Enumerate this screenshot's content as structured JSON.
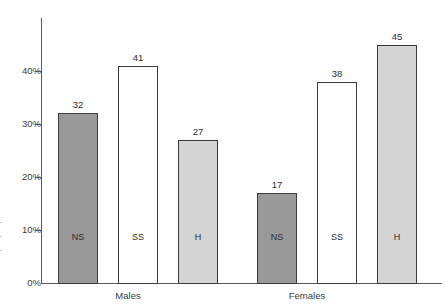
{
  "chart_data": {
    "type": "bar",
    "title": "",
    "subtitle": "",
    "xlabel": "",
    "ylabel": "",
    "ylim": [
      0,
      47
    ],
    "grid": false,
    "legend_position": "none",
    "value_suffix": "",
    "categories": [
      "Males",
      "Females"
    ],
    "subcategories": [
      "NS",
      "SS",
      "H"
    ],
    "y_ticks": [
      {
        "value": 0,
        "label": "0%"
      },
      {
        "value": 10,
        "label": "10%"
      },
      {
        "value": 20,
        "label": "20%"
      },
      {
        "value": 30,
        "label": "30%"
      },
      {
        "value": 40,
        "label": "40%"
      }
    ],
    "bars": [
      {
        "group": "Males",
        "subcategory": "NS",
        "value": 32,
        "label": "32",
        "inlabel": "NS",
        "fill": "#999999",
        "style": "fill-ns"
      },
      {
        "group": "Males",
        "subcategory": "SS",
        "value": 41,
        "label": "41",
        "inlabel": "SS",
        "fill": "#ffffff",
        "style": "fill-ss"
      },
      {
        "group": "Males",
        "subcategory": "H",
        "value": 27,
        "label": "27",
        "inlabel": "H",
        "fill": "#d4d4d4",
        "style": "fill-h"
      },
      {
        "group": "Females",
        "subcategory": "NS",
        "value": 17,
        "label": "17",
        "inlabel": "NS",
        "fill": "#999999",
        "style": "fill-ns"
      },
      {
        "group": "Females",
        "subcategory": "SS",
        "value": 38,
        "label": "38",
        "inlabel": "SS",
        "fill": "#ffffff",
        "style": "fill-ss"
      },
      {
        "group": "Females",
        "subcategory": "H",
        "value": 45,
        "label": "45",
        "inlabel": "H",
        "fill": "#d4d4d4",
        "style": "fill-h"
      }
    ],
    "series": [
      {
        "name": "NS",
        "values": [
          32,
          17
        ]
      },
      {
        "name": "SS",
        "values": [
          41,
          38
        ]
      },
      {
        "name": "H",
        "values": [
          27,
          45
        ]
      }
    ],
    "colors": {
      "ns": "#999999",
      "ss": "#ffffff",
      "h": "#d4d4d4",
      "axis": "#5a5a5a",
      "bar_border": "#3a3a3a",
      "text": "#2e2e2e",
      "background": "#ffffff"
    }
  },
  "geometry": {
    "axis_x": 41,
    "baseline_y": 283,
    "axis_top_y": 18,
    "px_per_unit": 5.3,
    "bar_width": 40,
    "bar_x": [
      58,
      118,
      178,
      257,
      317,
      377
    ],
    "group_label_y": 290,
    "group_label_x": [
      128,
      307
    ],
    "inlabel_y": 232
  }
}
